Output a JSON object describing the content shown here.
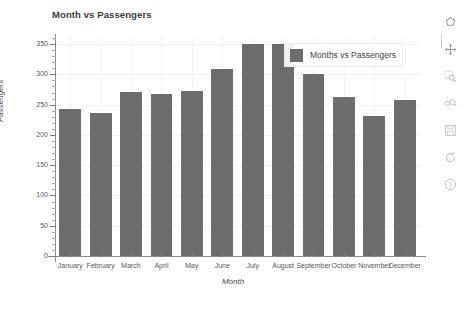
{
  "chart": {
    "title": "Month vs Passengers",
    "x_axis_title": "Month",
    "y_axis_title": "Passengers",
    "legend_label": "Months vs Passengers",
    "bar_color": "#6d6d6d",
    "background_color": "#ffffff",
    "gridline_color": "#f4f4f4",
    "axis_color": "#8b8b8b"
  },
  "chart_data": {
    "type": "bar",
    "title": "Month vs Passengers",
    "xlabel": "Month",
    "ylabel": "Passengers",
    "categories": [
      "January",
      "February",
      "March",
      "April",
      "May",
      "June",
      "July",
      "August",
      "September",
      "October",
      "November",
      "December"
    ],
    "values": [
      242,
      236,
      271,
      268,
      273,
      309,
      350,
      350,
      300,
      263,
      232,
      258
    ],
    "series": [
      {
        "name": "Months vs Passengers",
        "values": [
          242,
          236,
          271,
          268,
          273,
          309,
          350,
          350,
          300,
          263,
          232,
          258
        ]
      }
    ],
    "ylim": [
      0,
      360
    ],
    "yticks": [
      0,
      50,
      100,
      150,
      200,
      250,
      300,
      350
    ],
    "ytick_labels": [
      "0",
      "50",
      "100",
      "150",
      "200",
      "250",
      "300",
      "350"
    ],
    "grid": true,
    "legend_position": "top-right",
    "legend_entries": [
      "Months vs Passengers"
    ]
  },
  "yticks": [
    {
      "label": "350",
      "value": 350
    },
    {
      "label": "300",
      "value": 300
    },
    {
      "label": "250",
      "value": 250
    },
    {
      "label": "200",
      "value": 200
    },
    {
      "label": "150",
      "value": 150
    },
    {
      "label": "100",
      "value": 100
    },
    {
      "label": "50",
      "value": 50
    },
    {
      "label": "0",
      "value": 0
    }
  ],
  "toolbar": {
    "items": [
      {
        "name": "lasso-select-icon",
        "tooltip": "Lasso Select"
      },
      {
        "name": "pan-icon",
        "tooltip": "Pan"
      },
      {
        "name": "box-zoom-icon",
        "tooltip": "Box Zoom"
      },
      {
        "name": "wheel-zoom-icon",
        "tooltip": "Wheel Zoom"
      },
      {
        "name": "save-icon",
        "tooltip": "Save"
      },
      {
        "name": "reset-icon",
        "tooltip": "Reset"
      },
      {
        "name": "help-icon",
        "tooltip": "Help"
      }
    ]
  }
}
